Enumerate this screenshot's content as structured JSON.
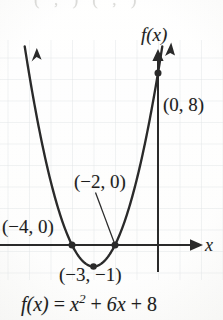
{
  "figure": {
    "kind": "graph-of-quadratic-function",
    "background_color": "#fbfbf9",
    "ink_color": "#2a2a2a",
    "grid_color": "#d8dce0",
    "clipped_top_fragment": "( , )   ( , )"
  },
  "axes": {
    "x_label": "x",
    "y_label": "f(x)",
    "x_axis_y_px": 245,
    "y_axis_x_px": 158,
    "unit_px": 21.5,
    "grid": true,
    "xlim": [
      -7.35,
      3.0
    ],
    "ylim": [
      -1.6,
      9.0
    ]
  },
  "labels": {
    "y_intercept": "(0, 8)",
    "root_right": "(−2, 0)",
    "root_left": "(−4, 0)",
    "vertex": "(−3, −1)",
    "equation_lhs": "f(x)",
    "equation_eq": "=",
    "equation_x": "x",
    "equation_exp": "2",
    "equation_rest": "+ 6x + 8"
  },
  "chart_data": {
    "type": "line",
    "title": "",
    "subtitle": "",
    "xlabel": "x",
    "ylabel": "f(x)",
    "xlim": [
      -7.35,
      3.0
    ],
    "ylim": [
      -1.6,
      9.0
    ],
    "grid": true,
    "legend": null,
    "function": "f(x) = x^2 + 6x + 8",
    "coefficients": {
      "a": 1,
      "b": 6,
      "c": 8
    },
    "vertex": [
      -3,
      -1
    ],
    "roots": [
      -4,
      -2
    ],
    "y_intercept": [
      0,
      8
    ],
    "series": [
      {
        "name": "f(x) = x^2 + 6x + 8",
        "x": [
          -6.4,
          -6.0,
          -5.5,
          -5.0,
          -4.5,
          -4.0,
          -3.5,
          -3.0,
          -2.5,
          -2.0,
          -1.5,
          -1.0,
          -0.5,
          0.0,
          0.4
        ],
        "values": [
          10.56,
          8.0,
          5.25,
          3.0,
          1.25,
          0.0,
          -0.75,
          -1.0,
          -0.75,
          0.0,
          1.25,
          3.0,
          5.25,
          8.0,
          10.56
        ]
      }
    ],
    "annotations": [
      {
        "text": "(0, 8)",
        "point": [
          0,
          8
        ],
        "marker": true,
        "leader": false
      },
      {
        "text": "(−2, 0)",
        "point": [
          -2,
          0
        ],
        "marker": true,
        "leader": true
      },
      {
        "text": "(−4, 0)",
        "point": [
          -4,
          0
        ],
        "marker": true,
        "leader": false
      },
      {
        "text": "(−3, −1)",
        "point": [
          -3,
          -1
        ],
        "marker": true,
        "leader": false
      }
    ]
  }
}
